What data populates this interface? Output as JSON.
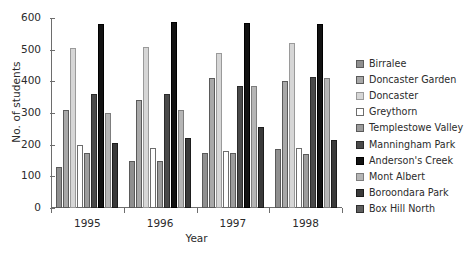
{
  "chart_data": {
    "type": "bar",
    "title": "",
    "xlabel": "Year",
    "ylabel": "No. of students",
    "categories": [
      "1995",
      "1996",
      "1997",
      "1998"
    ],
    "ylim": [
      0,
      600
    ],
    "yticks": [
      0,
      100,
      200,
      300,
      400,
      500,
      600
    ],
    "grid": false,
    "legend_position": "right",
    "series": [
      {
        "name": "Birralee",
        "color": "#8f8f8f",
        "edge": "#5a5a5a",
        "values": [
          130,
          150,
          175,
          185
        ]
      },
      {
        "name": "Doncaster Garden",
        "color": "#a8a8a8",
        "edge": "#5a5a5a",
        "values": [
          310,
          340,
          410,
          400
        ]
      },
      {
        "name": "Doncaster",
        "color": "#d6d6d6",
        "edge": "#9a9a9a",
        "values": [
          505,
          508,
          490,
          520
        ]
      },
      {
        "name": "Greythorn",
        "color": "#ffffff",
        "edge": "#6d6d6d",
        "values": [
          200,
          190,
          180,
          190
        ]
      },
      {
        "name": "Templestowe Valley",
        "color": "#9c9c9c",
        "edge": "#5a5a5a",
        "values": [
          175,
          150,
          175,
          170
        ]
      },
      {
        "name": "Manningham Park",
        "color": "#4a4a4a",
        "edge": "#2b2b2b",
        "values": [
          360,
          360,
          385,
          415
        ]
      },
      {
        "name": "Anderson's Creek",
        "color": "#121212",
        "edge": "#000000",
        "values": [
          580,
          588,
          585,
          580
        ]
      },
      {
        "name": "Mont Albert",
        "color": "#b5b5b5",
        "edge": "#7d7d7d",
        "values": [
          300,
          310,
          385,
          410
        ]
      },
      {
        "name": "Boroondara Park",
        "color": "#3a3a3a",
        "edge": "#1d1d1d",
        "values": [
          205,
          220,
          255,
          215
        ]
      },
      {
        "name": "Box Hill North",
        "color": "#5e5e5e",
        "edge": "#2f2f2f",
        "values": [
          null,
          null,
          null,
          null
        ]
      }
    ]
  },
  "legend": {
    "items": [
      {
        "label": "Birralee"
      },
      {
        "label": "Doncaster Garden"
      },
      {
        "label": "Doncaster"
      },
      {
        "label": "Greythorn"
      },
      {
        "label": "Templestowe Valley"
      },
      {
        "label": "Manningham Park"
      },
      {
        "label": "Anderson's Creek"
      },
      {
        "label": "Mont Albert"
      },
      {
        "label": "Boroondara Park"
      },
      {
        "label": "Box Hill North"
      }
    ]
  }
}
